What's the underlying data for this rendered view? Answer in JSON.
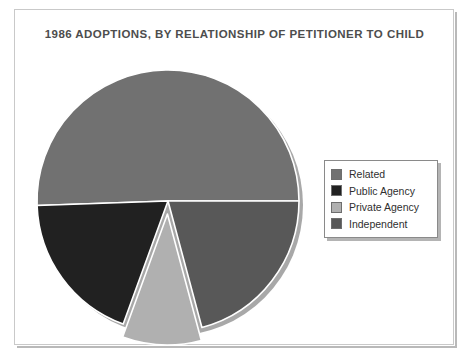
{
  "chart_data": {
    "type": "pie",
    "title": "1986 ADOPTIONS, BY RELATIONSHIP OF PETITIONER TO CHILD",
    "categories": [
      "Related",
      "Public Agency",
      "Private Agency",
      "Independent"
    ],
    "values": [
      50,
      19,
      10,
      21
    ],
    "unit": "percent",
    "legend_position": "right",
    "exploded_slices": [
      "Private Agency"
    ],
    "colors": {
      "Related": "#717171",
      "Public Agency": "#212121",
      "Private Agency": "#b0b0b0",
      "Independent": "#585858"
    },
    "slice_geometry": [
      {
        "name": "Related",
        "start_deg": 0,
        "end_deg": 182,
        "color": "#717171",
        "exploded": false
      },
      {
        "name": "Public Agency",
        "start_deg": 182,
        "end_deg": 250,
        "color": "#212121",
        "exploded": false
      },
      {
        "name": "Private Agency",
        "start_deg": 250,
        "end_deg": 285,
        "color": "#b0b0b0",
        "exploded": true
      },
      {
        "name": "Independent",
        "start_deg": 285,
        "end_deg": 360,
        "color": "#585858",
        "exploded": false
      }
    ],
    "xlabel": "",
    "ylabel": "",
    "grid": false
  },
  "chart": {
    "title": "1986 ADOPTIONS, BY RELATIONSHIP OF PETITIONER TO CHILD"
  },
  "legend": {
    "items": [
      {
        "label": "Related",
        "color": "#717171"
      },
      {
        "label": "Public Agency",
        "color": "#212121"
      },
      {
        "label": "Private Agency",
        "color": "#b0b0b0"
      },
      {
        "label": "Independent",
        "color": "#585858"
      }
    ]
  },
  "style": {
    "page_background": "#ffffff",
    "frame_border": "#c9c9c9",
    "title_color": "#4d4d4d",
    "slice_separator": "#ffffff"
  }
}
